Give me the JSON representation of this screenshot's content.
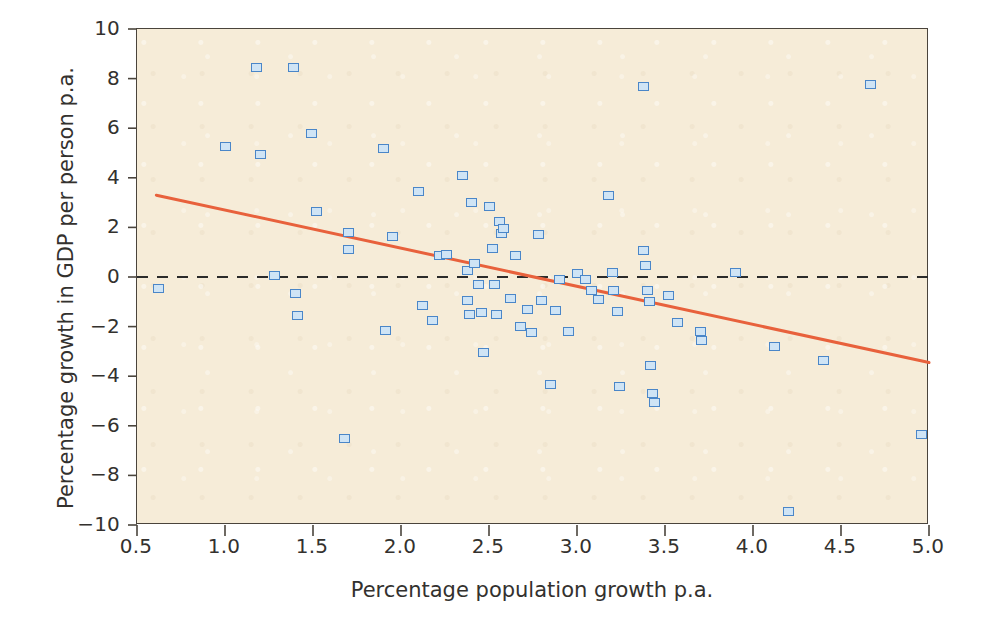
{
  "chart_data": {
    "type": "scatter",
    "title": "",
    "xlabel": "Percentage population growth p.a.",
    "ylabel": "Percentage growth in GDP per person p.a.",
    "xlim": [
      0.5,
      5.0
    ],
    "ylim": [
      -10,
      10
    ],
    "xticks": [
      "0.5",
      "1.0",
      "1.5",
      "2.0",
      "2.5",
      "3.0",
      "3.5",
      "4.0",
      "4.5",
      "5.0"
    ],
    "xtick_values": [
      0.5,
      1.0,
      1.5,
      2.0,
      2.5,
      3.0,
      3.5,
      4.0,
      4.5,
      5.0
    ],
    "yticks": [
      "10",
      "8",
      "6",
      "4",
      "2",
      "0",
      "−2",
      "−4",
      "−6",
      "−8",
      "−10"
    ],
    "ytick_values": [
      10,
      8,
      6,
      4,
      2,
      0,
      -2,
      -4,
      -6,
      -8,
      -10
    ],
    "grid": false,
    "legend": null,
    "marker": {
      "shape": "square-open",
      "fill_color": "#cfe4f5",
      "edge_color": "#4a86c8",
      "size_px": 11
    },
    "panel_color": "#f6ecd8",
    "frame_color": "#4a443c",
    "annotations": [
      {
        "name": "zero-reference-line",
        "type": "hline",
        "y": 0,
        "style": "dashed",
        "color": "#2b2b2b"
      },
      {
        "name": "regression-line",
        "type": "line",
        "x": [
          0.61,
          5.0
        ],
        "y": [
          3.3,
          -3.45
        ],
        "style": "solid",
        "color": "#e8613c"
      }
    ],
    "points": [
      {
        "x": 0.62,
        "y": -0.45
      },
      {
        "x": 1.0,
        "y": 5.25
      },
      {
        "x": 1.18,
        "y": 8.45
      },
      {
        "x": 1.2,
        "y": 4.95
      },
      {
        "x": 1.28,
        "y": 0.05
      },
      {
        "x": 1.39,
        "y": 8.45
      },
      {
        "x": 1.4,
        "y": -0.65
      },
      {
        "x": 1.41,
        "y": -1.55
      },
      {
        "x": 1.49,
        "y": 5.8
      },
      {
        "x": 1.52,
        "y": 2.65
      },
      {
        "x": 1.68,
        "y": -6.5
      },
      {
        "x": 1.7,
        "y": 1.8
      },
      {
        "x": 1.7,
        "y": 1.1
      },
      {
        "x": 1.9,
        "y": 5.2
      },
      {
        "x": 1.91,
        "y": -2.15
      },
      {
        "x": 1.95,
        "y": 1.65
      },
      {
        "x": 2.1,
        "y": 3.45
      },
      {
        "x": 2.12,
        "y": -1.15
      },
      {
        "x": 2.18,
        "y": -1.75
      },
      {
        "x": 2.22,
        "y": 0.85
      },
      {
        "x": 2.26,
        "y": 0.9
      },
      {
        "x": 2.35,
        "y": 4.1
      },
      {
        "x": 2.38,
        "y": 0.25
      },
      {
        "x": 2.38,
        "y": -0.95
      },
      {
        "x": 2.39,
        "y": -1.5
      },
      {
        "x": 2.4,
        "y": 3.0
      },
      {
        "x": 2.42,
        "y": 0.55
      },
      {
        "x": 2.44,
        "y": -0.3
      },
      {
        "x": 2.46,
        "y": -1.45
      },
      {
        "x": 2.47,
        "y": -3.05
      },
      {
        "x": 2.5,
        "y": 2.85
      },
      {
        "x": 2.52,
        "y": 1.15
      },
      {
        "x": 2.53,
        "y": -0.3
      },
      {
        "x": 2.54,
        "y": -1.5
      },
      {
        "x": 2.56,
        "y": 2.25
      },
      {
        "x": 2.57,
        "y": 1.75
      },
      {
        "x": 2.58,
        "y": 1.95
      },
      {
        "x": 2.62,
        "y": -0.85
      },
      {
        "x": 2.65,
        "y": 0.85
      },
      {
        "x": 2.68,
        "y": -2.0
      },
      {
        "x": 2.72,
        "y": -1.3
      },
      {
        "x": 2.74,
        "y": -2.25
      },
      {
        "x": 2.78,
        "y": 1.7
      },
      {
        "x": 2.8,
        "y": -0.95
      },
      {
        "x": 2.85,
        "y": -4.35
      },
      {
        "x": 2.88,
        "y": -1.35
      },
      {
        "x": 2.9,
        "y": -0.1
      },
      {
        "x": 2.95,
        "y": -2.2
      },
      {
        "x": 3.0,
        "y": 0.15
      },
      {
        "x": 3.05,
        "y": -0.1
      },
      {
        "x": 3.08,
        "y": -0.55
      },
      {
        "x": 3.12,
        "y": -0.9
      },
      {
        "x": 3.18,
        "y": 3.3
      },
      {
        "x": 3.2,
        "y": 0.2
      },
      {
        "x": 3.21,
        "y": -0.55
      },
      {
        "x": 3.23,
        "y": -1.4
      },
      {
        "x": 3.24,
        "y": -4.4
      },
      {
        "x": 3.38,
        "y": 7.7
      },
      {
        "x": 3.38,
        "y": 1.05
      },
      {
        "x": 3.39,
        "y": 0.45
      },
      {
        "x": 3.4,
        "y": -0.55
      },
      {
        "x": 3.41,
        "y": -1.0
      },
      {
        "x": 3.42,
        "y": -3.55
      },
      {
        "x": 3.43,
        "y": -4.7
      },
      {
        "x": 3.44,
        "y": -5.05
      },
      {
        "x": 3.52,
        "y": -0.75
      },
      {
        "x": 3.57,
        "y": -1.85
      },
      {
        "x": 3.7,
        "y": -2.2
      },
      {
        "x": 3.71,
        "y": -2.55
      },
      {
        "x": 3.9,
        "y": 0.2
      },
      {
        "x": 4.12,
        "y": -2.8
      },
      {
        "x": 4.2,
        "y": -9.45
      },
      {
        "x": 4.4,
        "y": -3.35
      },
      {
        "x": 4.67,
        "y": 7.75
      },
      {
        "x": 4.96,
        "y": -6.35
      }
    ]
  }
}
